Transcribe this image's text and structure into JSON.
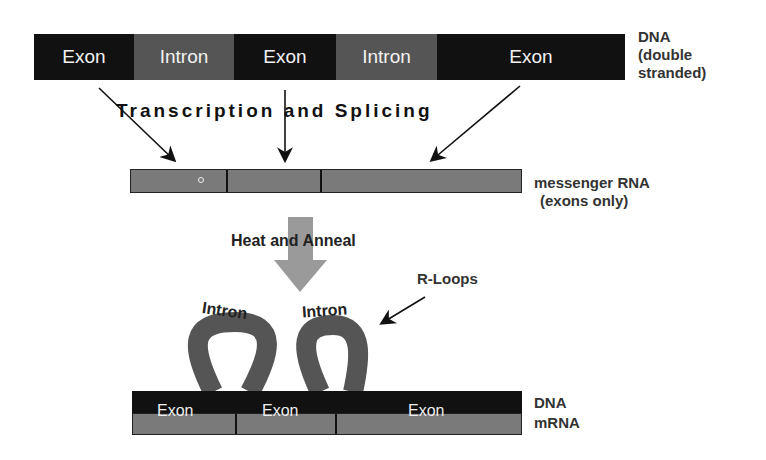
{
  "top_dna": {
    "segments": [
      {
        "type": "exon",
        "label": "Exon"
      },
      {
        "type": "intron",
        "label": "Intron"
      },
      {
        "type": "exon",
        "label": "Exon"
      },
      {
        "type": "intron",
        "label": "Intron"
      },
      {
        "type": "exon",
        "label": "Exon"
      }
    ],
    "label_line1": "DNA",
    "label_line2": "(double",
    "label_line3": "stranded)"
  },
  "process1": "Transcription and Splicing",
  "mrna": {
    "label_line1": "messenger RNA",
    "label_line2": "(exons only)"
  },
  "process2": "Heat and Anneal",
  "rloops": {
    "label": "R-Loops",
    "intron_labels": [
      "Intron",
      "Intron"
    ]
  },
  "hybrid": {
    "exon_labels": [
      "Exon",
      "Exon",
      "Exon"
    ],
    "dna_label": "DNA",
    "mrna_label": "mRNA"
  },
  "colors": {
    "exon": "#111111",
    "intron": "#555555",
    "mrna": "#7a7a7a",
    "arrow_gray": "#9a9a9a"
  }
}
